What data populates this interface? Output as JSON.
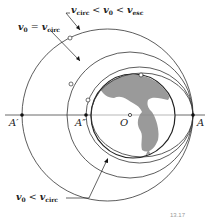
{
  "diagram": {
    "type": "orbital-trajectories",
    "labels": {
      "point_A": "A",
      "point_A_prime": "A′",
      "point_A_double_prime": "A″",
      "point_O": "O",
      "ellipse_label_v": "v",
      "ellipse_label_sub_circ": "circ",
      "ellipse_label_sub_0": "0",
      "ellipse_label_sub_esc": "esc",
      "ellipse_label_text": "v_circ < v_0 < v_esc",
      "circular_label_text": "v_0 = v_circ",
      "suborbital_label_text": "v_0 < v_circ"
    },
    "figure_number": "13.17",
    "colors": {
      "line": "#333333",
      "earth_land": "#9a9a9a",
      "earth_outline": "#222222",
      "background": "#ffffff"
    }
  }
}
